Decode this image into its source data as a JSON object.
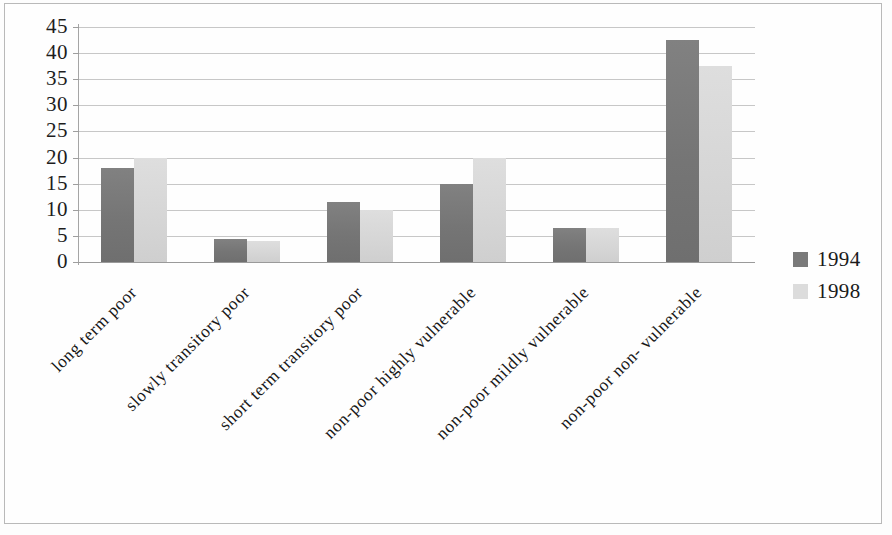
{
  "chart_data": {
    "type": "bar",
    "title": "",
    "subtitle": "",
    "xlabel": "",
    "ylabel": "",
    "ylim": [
      0,
      45
    ],
    "ytick_step": 5,
    "yticks": [
      45,
      40,
      35,
      30,
      25,
      20,
      15,
      10,
      5,
      0
    ],
    "grid": true,
    "legend_position": "right",
    "categories": [
      "long term poor",
      "slowly transitory poor",
      "short term transitory poor",
      "non-poor highly vulnerable",
      "non-poor mildly vulnerable",
      "non-poor non- vulnerable"
    ],
    "series": [
      {
        "name": "1994",
        "color": "#7a7a7a",
        "values": [
          18,
          4.5,
          11.5,
          15,
          6.5,
          42.5
        ]
      },
      {
        "name": "1998",
        "color": "#d8d8d8",
        "values": [
          20,
          4,
          10,
          20,
          6.5,
          37.5
        ]
      }
    ]
  },
  "legend": {
    "items": [
      {
        "label": "1994",
        "color": "#7a7a7a"
      },
      {
        "label": "1998",
        "color": "#d8d8d8"
      }
    ]
  },
  "axis": {
    "y_tick_labels": [
      "45",
      "40",
      "35",
      "30",
      "25",
      "20",
      "15",
      "10",
      "5",
      "0"
    ]
  }
}
